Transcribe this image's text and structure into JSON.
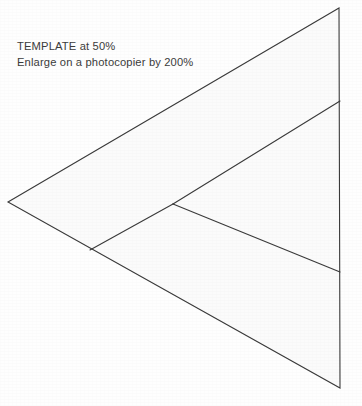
{
  "page": {
    "width": 362,
    "height": 406,
    "background_color": "#fefefe",
    "paper_tint": "#fcfcfc"
  },
  "instructions": {
    "line1": "TEMPLATE at 50%",
    "line2": "Enlarge on a photocopier by 200%",
    "text_color": "#3b3b3b"
  },
  "diagram": {
    "name": "folding-template-triangle",
    "stroke_color": "#3a3a3a",
    "fill_color": "#fbfbfb",
    "stroke_width": 1.1,
    "outline": {
      "label": "large-triangle-outline",
      "points": "8,202 339,8 340,388"
    },
    "fold_lines": [
      {
        "label": "upper-diagonal-fold",
        "from_x": 340,
        "from_y": 101,
        "to_x": 173,
        "to_y": 204
      },
      {
        "label": "lower-diagonal-fold",
        "from_x": 173,
        "from_y": 204,
        "to_x": 340,
        "to_y": 272
      },
      {
        "label": "short-left-fold",
        "from_x": 173,
        "from_y": 204,
        "to_x": 90,
        "to_y": 250
      }
    ],
    "vertices": [
      {
        "label": "left-apex",
        "x": 8,
        "y": 202
      },
      {
        "label": "top-apex",
        "x": 339,
        "y": 8
      },
      {
        "label": "bottom-apex",
        "x": 340,
        "y": 388
      },
      {
        "label": "center-junction",
        "x": 173,
        "y": 204
      },
      {
        "label": "lower-left-junction",
        "x": 90,
        "y": 250
      },
      {
        "label": "right-edge-upper-node",
        "x": 340,
        "y": 101
      },
      {
        "label": "right-edge-lower-node",
        "x": 340,
        "y": 272
      }
    ]
  }
}
